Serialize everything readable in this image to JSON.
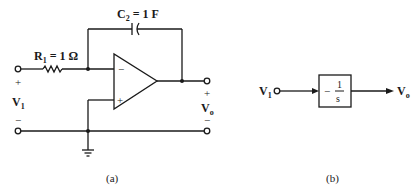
{
  "figure_a": {
    "caption": "(a)",
    "capacitor_label": "C",
    "capacitor_sub": "2",
    "capacitor_value": " = 1 F",
    "resistor_label": "R",
    "resistor_sub": "1",
    "resistor_value": " = 1 Ω",
    "opamp_minus": "−",
    "opamp_plus": "+",
    "input_plus": "+",
    "input_minus": "−",
    "input_label": "V",
    "input_sub": "1",
    "output_plus": "+",
    "output_minus": "−",
    "output_label": "V",
    "output_sub": "o"
  },
  "figure_b": {
    "caption": "(b)",
    "input_label": "V",
    "input_sub": "1",
    "block_sign": "−",
    "block_num": "1",
    "block_den": "s",
    "output_label": "V",
    "output_sub": "o"
  }
}
